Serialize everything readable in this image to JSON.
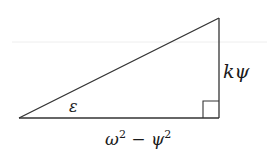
{
  "diagram": {
    "type": "right-triangle",
    "colors": {
      "stroke": "#333333",
      "text": "#1a1a1a",
      "background": "#ffffff",
      "faint_line": "#eeeeee"
    },
    "vertices": {
      "left": [
        19,
        118
      ],
      "right_angle": [
        219,
        118
      ],
      "top": [
        219,
        18
      ]
    },
    "labels": {
      "angle": "ε",
      "vertical_side": "kψ",
      "base_omega": "ω",
      "base_exp1": "2",
      "base_minus": " − ",
      "base_psi": "ψ",
      "base_exp2": "2"
    }
  }
}
